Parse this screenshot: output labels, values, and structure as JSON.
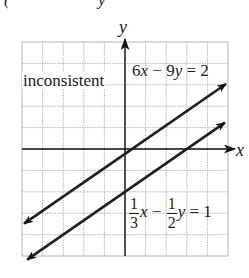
{
  "header_fragment": {
    "left": "(",
    "right": "y"
  },
  "chart_data": {
    "type": "line",
    "title": "",
    "xlabel": "x",
    "ylabel": "y",
    "grid": true,
    "xlim": [
      -5,
      5
    ],
    "ylim": [
      -5,
      5
    ],
    "annotation": "inconsistent",
    "series": [
      {
        "name": "6x − 9y = 2",
        "equation": "6x - 9y = 2",
        "slope": 0.6667,
        "intercept": -0.2222,
        "x": [
          -4.9,
          4.9
        ],
        "y": [
          -3.49,
          3.04
        ]
      },
      {
        "name": "(1/3)x − (1/2)y = 1",
        "equation": "1/3x - 1/2y = 1",
        "slope": 0.6667,
        "intercept": -2,
        "x": [
          -4.75,
          4.85
        ],
        "y": [
          -5.17,
          1.23
        ]
      }
    ]
  },
  "labels": {
    "y_axis": "y",
    "x_axis": "x",
    "annotation": "inconsistent",
    "eq1": {
      "a": "6",
      "v1": "x",
      "op": " − 9",
      "v2": "y",
      "rhs": " = 2"
    },
    "eq2": {
      "n1": "1",
      "d1": "3",
      "v1": "x",
      "op": " − ",
      "n2": "1",
      "d2": "2",
      "v2": "y",
      "rhs": " = 1"
    }
  },
  "style": {
    "line_color": "#1f1f1f",
    "grid_color": "#b5b5b5",
    "axis_color": "#111111"
  }
}
